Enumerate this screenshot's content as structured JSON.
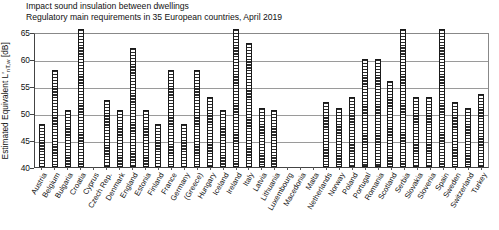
{
  "title": {
    "line1": "Impact sound insulation between dwellings",
    "line2": "Regulatory main requirements in 35 European countries, April 2019"
  },
  "axis": {
    "y_label_prefix": "Estimated Equivalent L",
    "y_label_prime": "'",
    "y_label_sub": "nT,w",
    "y_label_suffix": " [dB]",
    "y_ticks": [
      "65",
      "60",
      "55",
      "50",
      "45",
      "40"
    ]
  },
  "chart_data": {
    "type": "bar",
    "xlabel": "",
    "ylabel": "Estimated Equivalent L'nT,w [dB]",
    "ylim": [
      40,
      65
    ],
    "yticks": [
      40,
      45,
      50,
      55,
      60,
      65
    ],
    "grid": true,
    "legend": "none",
    "categories": [
      "Austria",
      "Belgium",
      "Bulgaria",
      "Croatia",
      "Cyprus",
      "Czech Rep.",
      "Denmark",
      "England",
      "Estonia",
      "Finland",
      "France",
      "Germany",
      "(Greece)",
      "Hungary",
      "Iceland",
      "Ireland",
      "Italy",
      "Latvia",
      "Lithuania",
      "Luxembourg",
      "Macedonia",
      "Malta",
      "Netherlands",
      "Norway",
      "Poland",
      "Portugal",
      "Romania",
      "Scotland",
      "Serbia",
      "Slovakia",
      "Slovenia",
      "Spain",
      "Sweden",
      "Switzerland",
      "Turkey"
    ],
    "values": [
      48,
      58,
      50.5,
      66,
      null,
      52.5,
      50.5,
      62,
      50.5,
      48,
      58,
      48,
      58,
      53,
      50.5,
      66,
      63,
      51,
      50.5,
      null,
      null,
      null,
      52,
      51,
      53,
      60,
      60,
      56,
      66,
      53,
      53,
      66,
      52,
      51,
      53.5
    ]
  }
}
